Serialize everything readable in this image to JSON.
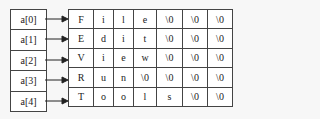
{
  "pointers": [
    "a[0]",
    "a[1]",
    "a[2]",
    "a[3]",
    "a[4]"
  ],
  "rows": [
    [
      "F",
      "i",
      "l",
      "e",
      "\\0",
      "\\0",
      "\\0"
    ],
    [
      "E",
      "d",
      "i",
      "t",
      "\\0",
      "\\0",
      "\\0"
    ],
    [
      "V",
      "i",
      "e",
      "w",
      "\\0",
      "\\0",
      "\\0"
    ],
    [
      "R",
      "u",
      "n",
      "\\0",
      "\\0",
      "\\0",
      "\\0"
    ],
    [
      "T",
      "o",
      "o",
      "l",
      "s",
      "\\0",
      "\\0"
    ]
  ]
}
